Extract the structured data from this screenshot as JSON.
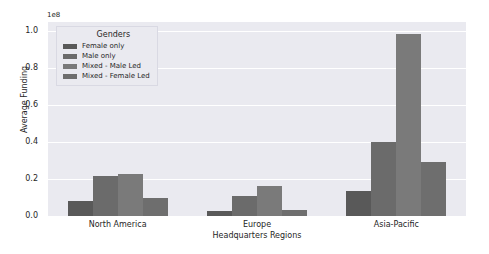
{
  "chart_data": {
    "type": "bar",
    "title": "",
    "xlabel": "Headquarters Regions",
    "ylabel": "Average Funding",
    "y_offset_text": "1e8",
    "categories": [
      "North America",
      "Europe",
      "Asia-Pacific"
    ],
    "series": [
      {
        "name": "Female only",
        "color": "#595959",
        "values": [
          0.08,
          0.025,
          0.135
        ]
      },
      {
        "name": "Male only",
        "color": "#6b6b6b",
        "values": [
          0.215,
          0.11,
          0.4
        ]
      },
      {
        "name": "Mixed - Male Led",
        "color": "#7a7a7a",
        "values": [
          0.225,
          0.16,
          0.985
        ]
      },
      {
        "name": "Mixed - Female Led",
        "color": "#6e6e6e",
        "values": [
          0.1,
          0.03,
          0.29
        ]
      }
    ],
    "ylim": [
      0.0,
      1.05
    ],
    "yticks": [
      "0.0",
      "0.2",
      "0.4",
      "0.6",
      "0.8",
      "1.0"
    ],
    "ytick_values": [
      0.0,
      0.2,
      0.4,
      0.6,
      0.8,
      1.0
    ],
    "grid": true,
    "legend": {
      "title": "Genders",
      "position": "upper-left",
      "entries": [
        "Female only",
        "Male only",
        "Mixed - Male Led",
        "Mixed - Female Led"
      ]
    },
    "plot_background": "#eaeaf0",
    "figure_background": "#ffffff",
    "gridline_color": "#ffffff"
  }
}
